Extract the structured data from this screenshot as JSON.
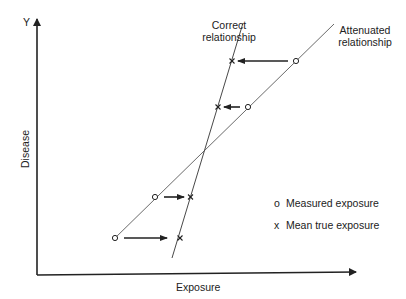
{
  "diagram": {
    "type": "regression-dilution-illustration",
    "axes": {
      "y_label_short": "Y",
      "y_label": "Disease",
      "x_label": "Exposure"
    },
    "lines": [
      {
        "name": "Correct relationship",
        "line1": "Correct",
        "line2": "relationship"
      },
      {
        "name": "Attenuated relationship",
        "line1": "Attenuated",
        "line2": "relationship"
      }
    ],
    "legend": [
      {
        "symbol": "o",
        "label": "Measured exposure"
      },
      {
        "symbol": "x",
        "label": "Mean true exposure"
      }
    ],
    "point_pairs": [
      {
        "measured": [
          115,
          238
        ],
        "true": [
          180,
          238
        ],
        "arrow_direction": "right"
      },
      {
        "measured": [
          155,
          197
        ],
        "true": [
          190,
          197
        ],
        "arrow_direction": "right"
      },
      {
        "measured": [
          248,
          107
        ],
        "true": [
          218,
          107
        ],
        "arrow_direction": "left"
      },
      {
        "measured": [
          296,
          61
        ],
        "true": [
          232,
          61
        ],
        "arrow_direction": "left"
      }
    ]
  }
}
